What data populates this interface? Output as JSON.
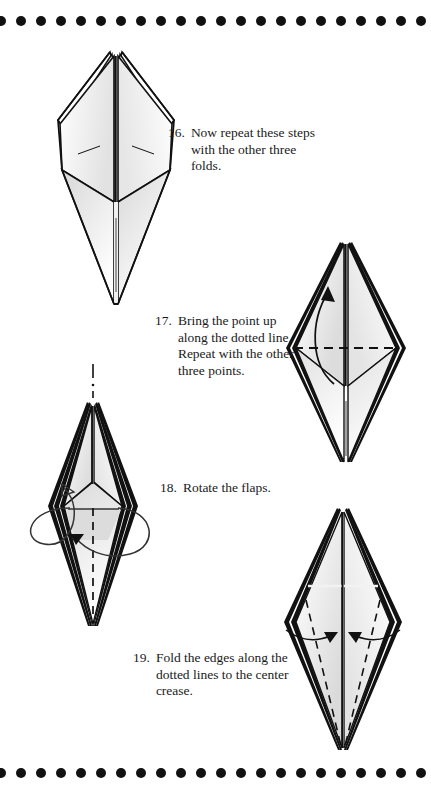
{
  "page": {
    "background_color": "#ffffff",
    "ink_color": "#111111",
    "border": {
      "style": "dotted",
      "dot_color": "#111111",
      "dot_diameter": 10,
      "dot_spacing": 20,
      "positions": [
        "top",
        "bottom"
      ]
    }
  },
  "steps": [
    {
      "number": "16.",
      "text": "Now repeat these steps with the other three folds.",
      "figure": {
        "name": "kite-with-split-top-flaps",
        "description": "Diamond body with four layered flaps spread at the top and a long pointed tail below; small valley crease marks on left and right panels.",
        "annotations": [
          "center-vertical-crease",
          "left-crease-tick",
          "right-crease-tick"
        ]
      }
    },
    {
      "number": "17.",
      "text": "Bring the point up along the dotted line. Repeat with the other three points.",
      "figure": {
        "name": "diamond-with-horizontal-fold-line",
        "description": "Narrow diamond of stacked layers with a horizontal dashed fold line across the middle and a curved arrow sweeping the lower point upward.",
        "annotations": [
          "horizontal-dashed-fold-line",
          "curved-up-arrow",
          "center-vertical-crease"
        ]
      }
    },
    {
      "number": "18.",
      "text": "Rotate the flaps.",
      "figure": {
        "name": "diamond-with-rotation-arrows",
        "description": "Layered diamond with a dash-dot axis above the tip, a dashed center line below, an open looping arrow on the left and a wrapping loop arrow on the right indicating rotation.",
        "annotations": [
          "dash-dot-axis",
          "dashed-center-line",
          "left-open-loop-arrow",
          "right-wrap-loop-arrow",
          "inward-solid-arrow"
        ]
      }
    },
    {
      "number": "19.",
      "text": "Fold the edges along the dotted lines to the center crease.",
      "figure": {
        "name": "kite-with-two-dashed-fold-lines",
        "description": "Tall kite of stacked layers with two dashed diagonal fold lines running from the side corners to the bottom point and two curved arrows pointing inward to the center crease.",
        "annotations": [
          "left-dashed-fold-line",
          "right-dashed-fold-line",
          "left-inward-arrow",
          "right-inward-arrow",
          "center-vertical-crease"
        ]
      }
    }
  ]
}
